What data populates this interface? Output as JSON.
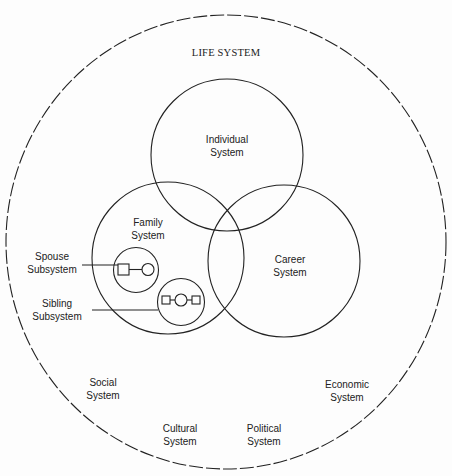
{
  "diagram": {
    "title": "LIFE SYSTEM",
    "colors": {
      "stroke": "#222222",
      "background": "#fdfdfd",
      "text": "#222222"
    },
    "outer": {
      "name": "Life System",
      "style": "dashed"
    },
    "circles": {
      "individual": {
        "line1": "Individual",
        "line2": "System"
      },
      "family": {
        "line1": "Family",
        "line2": "System"
      },
      "career": {
        "line1": "Career",
        "line2": "System"
      }
    },
    "subsystems": {
      "spouse": {
        "line1": "Spouse",
        "line2": "Subsystem",
        "symbols": [
          "square",
          "circle"
        ]
      },
      "sibling": {
        "line1": "Sibling",
        "line2": "Subsystem",
        "symbols": [
          "square",
          "circle",
          "square"
        ]
      }
    },
    "external": {
      "social": {
        "line1": "Social",
        "line2": "System"
      },
      "economic": {
        "line1": "Economic",
        "line2": "System"
      },
      "cultural": {
        "line1": "Cultural",
        "line2": "System"
      },
      "political": {
        "line1": "Political",
        "line2": "System"
      }
    }
  }
}
